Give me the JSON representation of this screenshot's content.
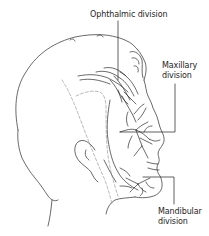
{
  "figure": {
    "line_color": "#2a2a2a",
    "dashed_color": "#8a8a8a",
    "labels": {
      "ophthalmic": {
        "line1": "Ophthalmic division"
      },
      "maxillary": {
        "line1": "Maxillary",
        "line2": "division"
      },
      "mandibular": {
        "line1": "Mandibular",
        "line2": "division"
      }
    }
  }
}
